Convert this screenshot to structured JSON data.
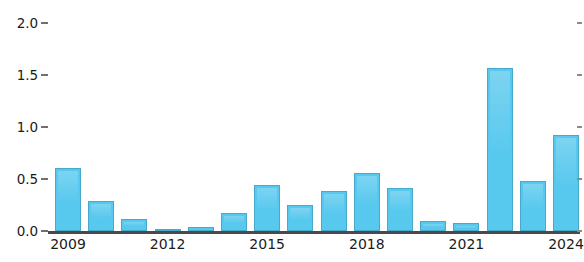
{
  "chart_data": {
    "type": "bar",
    "title": "",
    "subtitle": "",
    "xlabel": "",
    "ylabel": "",
    "categories": [
      "2009",
      "2010",
      "2011",
      "2012",
      "2013",
      "2014",
      "2015",
      "2016",
      "2017",
      "2018",
      "2019",
      "2020",
      "2021",
      "2022",
      "2023",
      "2024"
    ],
    "values": [
      0.61,
      0.29,
      0.12,
      0.02,
      0.04,
      0.17,
      0.44,
      0.25,
      0.38,
      0.56,
      0.41,
      0.1,
      0.08,
      1.57,
      0.48,
      0.92
    ],
    "series": [
      {
        "name": "",
        "values": [
          0.61,
          0.29,
          0.12,
          0.02,
          0.04,
          0.17,
          0.44,
          0.25,
          0.38,
          0.56,
          0.41,
          0.1,
          0.08,
          1.57,
          0.48,
          0.92
        ]
      }
    ],
    "ylim": [
      0.0,
      2.0
    ],
    "yticks": [
      0.0,
      0.5,
      1.0,
      1.5,
      2.0
    ],
    "ytick_labels": [
      "0.0",
      "0.5",
      "1.0",
      "1.5",
      "2.0"
    ],
    "xtick_labels": [
      "2009",
      "2012",
      "2015",
      "2018",
      "2021",
      "2024"
    ],
    "grid": false,
    "legend": null,
    "legend_position": "none",
    "bar_color": "#57c8ee",
    "bar_edge_color": "#49a9cb",
    "axis_color": "#4a4a4a",
    "text_color": "#1b1b1b",
    "background": "#ffffff"
  }
}
